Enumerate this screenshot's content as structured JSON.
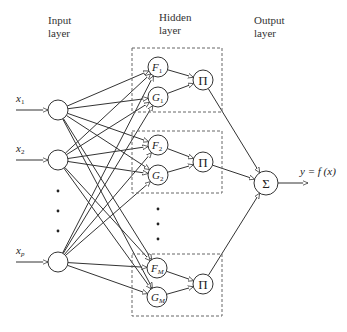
{
  "layers": {
    "input": {
      "label_line1": "Input",
      "label_line2": "layer"
    },
    "hidden": {
      "label_line1": "Hidden",
      "label_line2": "layer"
    },
    "output": {
      "label_line1": "Output",
      "label_line2": "layer"
    }
  },
  "inputs": [
    {
      "label": "x",
      "sub": "1",
      "cx": 58,
      "cy": 110
    },
    {
      "label": "x",
      "sub": "2",
      "cx": 58,
      "cy": 160
    },
    {
      "label": "x",
      "sub": "p",
      "cx": 58,
      "cy": 262
    }
  ],
  "input_ellipsis": [
    {
      "x": 58,
      "y": 191
    },
    {
      "x": 58,
      "y": 211
    },
    {
      "x": 58,
      "y": 231
    }
  ],
  "hidden_groups": [
    {
      "box": {
        "x": 132,
        "y": 48,
        "w": 90,
        "h": 64
      },
      "f": {
        "label": "F",
        "sub": "1",
        "cx": 158,
        "cy": 67
      },
      "g": {
        "label": "G",
        "sub": "1",
        "cx": 158,
        "cy": 97
      },
      "prod": {
        "label": "Π",
        "cx": 203,
        "cy": 80
      }
    },
    {
      "box": {
        "x": 132,
        "y": 131,
        "w": 90,
        "h": 62
      },
      "f": {
        "label": "F",
        "sub": "2",
        "cx": 158,
        "cy": 145
      },
      "g": {
        "label": "G",
        "sub": "2",
        "cx": 158,
        "cy": 175
      },
      "prod": {
        "label": "Π",
        "cx": 203,
        "cy": 162
      }
    },
    {
      "box": {
        "x": 132,
        "y": 254,
        "w": 90,
        "h": 62
      },
      "f": {
        "label": "F",
        "sub": "M",
        "cx": 157,
        "cy": 268
      },
      "g": {
        "label": "G",
        "sub": "M",
        "cx": 157,
        "cy": 297
      },
      "prod": {
        "label": "Π",
        "cx": 203,
        "cy": 284
      }
    }
  ],
  "hidden_ellipsis": [
    {
      "x": 158,
      "y": 209
    },
    {
      "x": 158,
      "y": 224
    },
    {
      "x": 158,
      "y": 239
    }
  ],
  "output": {
    "label": "Σ",
    "cx": 266,
    "cy": 183,
    "formula": "y = f (x)"
  }
}
